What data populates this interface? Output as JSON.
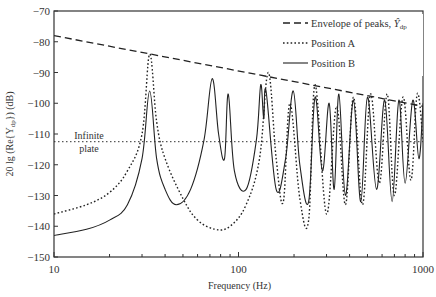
{
  "chart_data": {
    "type": "line",
    "title": "",
    "xlabel": "Frequency (Hz)",
    "ylabel": "20 lg (Re{Y_dp}) (dB)",
    "xscale": "log",
    "xlim": [
      10,
      1000
    ],
    "ylim": [
      -150,
      -70
    ],
    "xticks": [
      10,
      100,
      1000
    ],
    "xtick_labels": [
      "10",
      "100",
      "1000"
    ],
    "yticks": [
      -150,
      -140,
      -130,
      -120,
      -110,
      -100,
      -90,
      -80,
      -70
    ],
    "ytick_labels": [
      "-150",
      "-140",
      "-130",
      "-120",
      "-110",
      "-100",
      "-90",
      "-80",
      "-70"
    ],
    "grid": false,
    "legend_position": "upper right",
    "annotations": [
      {
        "text_line1": "Infinite",
        "text_line2": "plate",
        "x": 14,
        "y": -112.5
      }
    ],
    "series": [
      {
        "name": "Envelope of peaks, Ŷdp",
        "style": "dashed",
        "x": [
          10,
          1000
        ],
        "y": [
          -78,
          -101
        ]
      },
      {
        "name": "Position A",
        "style": "dotted",
        "x": [
          10,
          15,
          20,
          25,
          30,
          33,
          36,
          40,
          50,
          60,
          75,
          90,
          110,
          130,
          145,
          160,
          175,
          190,
          215,
          240,
          260,
          300,
          340,
          380,
          420,
          470,
          520,
          580,
          640,
          700,
          780,
          860,
          930,
          1000
        ],
        "y": [
          -136,
          -133,
          -129,
          -122,
          -110,
          -84,
          -106,
          -118,
          -131,
          -138,
          -141,
          -140,
          -133,
          -118,
          -90,
          -118,
          -132,
          -100,
          -131,
          -138,
          -94,
          -136,
          -101,
          -133,
          -98,
          -133,
          -97,
          -126,
          -97,
          -130,
          -98,
          -125,
          -97,
          -112
        ]
      },
      {
        "name": "Position B",
        "style": "solid",
        "x": [
          10,
          15,
          20,
          25,
          30,
          33,
          36,
          40,
          46,
          55,
          65,
          72,
          78,
          84,
          88,
          95,
          110,
          125,
          132,
          137,
          141,
          160,
          180,
          198,
          215,
          240,
          260,
          285,
          310,
          330,
          350,
          380,
          420,
          460,
          500,
          560,
          620,
          680,
          740,
          800,
          880,
          950,
          1000
        ],
        "y": [
          -143,
          -141,
          -138,
          -133,
          -118,
          -96,
          -118,
          -128,
          -133,
          -128,
          -112,
          -92,
          -110,
          -118,
          -97,
          -122,
          -128,
          -112,
          -94,
          -105,
          -96,
          -128,
          -118,
          -96,
          -120,
          -132,
          -98,
          -122,
          -100,
          -128,
          -97,
          -130,
          -99,
          -132,
          -98,
          -128,
          -99,
          -132,
          -99,
          -126,
          -99,
          -118,
          -100
        ]
      }
    ]
  },
  "legend": {
    "items": [
      {
        "label": "Envelope of peaks, ",
        "symbol": "Ŷ",
        "subscript": "dp",
        "style": "dashed"
      },
      {
        "label": "Position A",
        "style": "dotted"
      },
      {
        "label": "Position B",
        "style": "solid"
      }
    ]
  },
  "annotation": {
    "line1": "Infinite",
    "line2": "plate"
  },
  "axes": {
    "xlabel": "Frequency (Hz)",
    "ylabel": "20 lg (Re{Y",
    "ylabel_sub": "dp",
    "ylabel_end": "}) (dB)"
  }
}
